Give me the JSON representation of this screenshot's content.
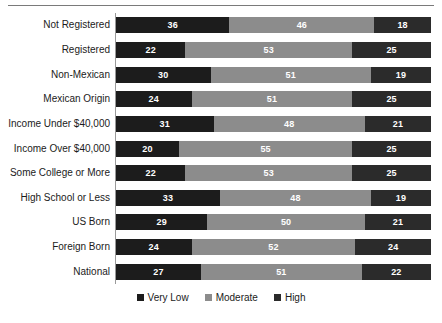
{
  "chart_data": {
    "type": "bar",
    "orientation": "horizontal",
    "stacked": true,
    "title": "",
    "subtitle": "",
    "xlabel": "",
    "ylabel": "",
    "xlim": [
      0,
      100
    ],
    "grid": false,
    "legend_position": "bottom-center",
    "categories": [
      "Not Registered",
      "Registered",
      "Non-Mexican",
      "Mexican Origin",
      "Income Under $40,000",
      "Income Over $40,000",
      "Some College or More",
      "High School or Less",
      "US Born",
      "Foreign Born",
      "National"
    ],
    "series": [
      {
        "name": "Very Low",
        "color": "#1c1c1c",
        "values": [
          36,
          22,
          30,
          24,
          31,
          20,
          22,
          33,
          29,
          24,
          27
        ]
      },
      {
        "name": "Moderate",
        "color": "#8c8c8c",
        "values": [
          46,
          53,
          51,
          51,
          48,
          55,
          53,
          48,
          50,
          52,
          51
        ]
      },
      {
        "name": "High",
        "color": "#2b2b2b",
        "values": [
          18,
          25,
          19,
          25,
          21,
          25,
          25,
          19,
          21,
          24,
          22
        ]
      }
    ],
    "legend": [
      {
        "label": "Very Low",
        "color": "#1c1c1c"
      },
      {
        "label": "Moderate",
        "color": "#8c8c8c"
      },
      {
        "label": "High",
        "color": "#2b2b2b"
      }
    ]
  }
}
